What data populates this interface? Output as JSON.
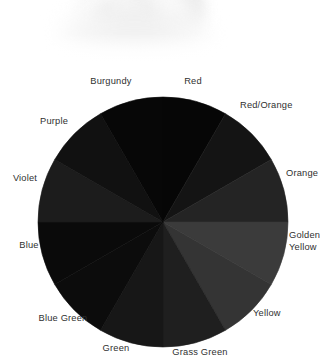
{
  "figure": {
    "kind": "color-wheel",
    "background_color": "#ffffff",
    "rendering": "grayscale",
    "center_x": 163,
    "center_y": 222,
    "radius": 125
  },
  "photo": {
    "description": "blurred pale grayscale photo fragment",
    "present": true
  },
  "chart_data": {
    "type": "pie",
    "title": "",
    "subtitle": "",
    "xlabel": "",
    "ylabel": "",
    "legend_position": "around-slices",
    "grid": false,
    "equal_slices": true,
    "slice_count": 12,
    "slice_degrees": 30,
    "start_angle_deg": -90,
    "categories": [
      "Red",
      "Red/Orange",
      "Orange",
      "Golden Yellow",
      "Yellow",
      "Grass Green",
      "Green",
      "Blue Green",
      "Blue",
      "Violet",
      "Purple",
      "Burgundy"
    ],
    "values": [
      30,
      30,
      30,
      30,
      30,
      30,
      30,
      30,
      30,
      30,
      30,
      30
    ],
    "colors": [
      "#060606",
      "#141414",
      "#242424",
      "#3b3b3b",
      "#343434",
      "#1f1f1f",
      "#171717",
      "#0c0c0c",
      "#0a0a0a",
      "#1c1c1c",
      "#111111",
      "#070707"
    ],
    "annotations": [
      {
        "label": "Red",
        "x": 193,
        "y": 76,
        "align": "center"
      },
      {
        "label": "Red/Orange",
        "x": 240,
        "y": 100,
        "align": "right"
      },
      {
        "label": "Orange",
        "x": 286,
        "y": 168,
        "align": "right"
      },
      {
        "label": "Golden\nYellow",
        "x": 289,
        "y": 230,
        "align": "right"
      },
      {
        "label": "Yellow",
        "x": 253,
        "y": 308,
        "align": "right"
      },
      {
        "label": "Grass Green",
        "x": 200,
        "y": 347,
        "align": "center"
      },
      {
        "label": "Green",
        "x": 116,
        "y": 343,
        "align": "center"
      },
      {
        "label": "Blue Green",
        "x": 63,
        "y": 313,
        "align": "center"
      },
      {
        "label": "Blue",
        "x": 29,
        "y": 240,
        "align": "center"
      },
      {
        "label": "Violet",
        "x": 25,
        "y": 173,
        "align": "center"
      },
      {
        "label": "Purple",
        "x": 54,
        "y": 116,
        "align": "center"
      },
      {
        "label": "Burgundy",
        "x": 111,
        "y": 76,
        "align": "center"
      }
    ]
  }
}
